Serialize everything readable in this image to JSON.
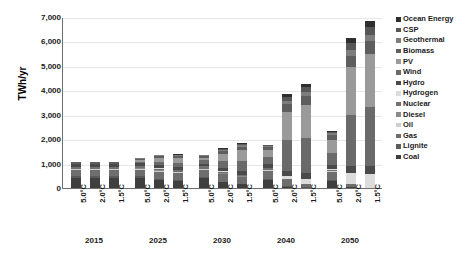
{
  "chart_data": {
    "type": "bar",
    "stacked": true,
    "title": "",
    "subtitle": "",
    "xlabel": "",
    "ylabel": "TWh/yr",
    "ylim": [
      0,
      7000
    ],
    "ytick_values": [
      0,
      1000,
      2000,
      3000,
      4000,
      5000,
      6000,
      7000
    ],
    "ytick_labels": [
      "0",
      "1,000",
      "2,000",
      "3,000",
      "4,000",
      "5,000",
      "6,000",
      "7,000"
    ],
    "grid": true,
    "legend_position": "right",
    "categories": [
      "2015 5.0°C",
      "2015 2.0°C",
      "2015 1.5°C",
      "2025 5.0°C",
      "2025 2.0°C",
      "2025 1.5°C",
      "2030 5.0°C",
      "2030 2.0°C",
      "2030 1.5°C",
      "2040 5.0°C",
      "2040 2.0°C",
      "2040 1.5°C",
      "2050 5.0°C",
      "2050 2.0°C",
      "2050 1.5°C"
    ],
    "scenario_labels": [
      "5.0°C",
      "2.0°C",
      "1.5°C"
    ],
    "year_groups": [
      "2015",
      "2025",
      "2030",
      "2040",
      "2050"
    ],
    "totals": [
      1010,
      1010,
      1010,
      1180,
      1330,
      1290,
      1420,
      1620,
      1810,
      1930,
      3820,
      4220,
      2810,
      6100,
      6720
    ],
    "series": [
      {
        "name": "Coal",
        "color": "#3f3f3f",
        "values": [
          430,
          430,
          430,
          420,
          330,
          300,
          390,
          230,
          150,
          330,
          60,
          20,
          270,
          30,
          0
        ]
      },
      {
        "name": "Lignite",
        "color": "#5a5a5a",
        "values": [
          60,
          60,
          60,
          60,
          50,
          45,
          55,
          35,
          25,
          45,
          15,
          5,
          40,
          5,
          0
        ]
      },
      {
        "name": "Gas",
        "color": "#6e6e6e",
        "values": [
          230,
          230,
          230,
          270,
          290,
          270,
          300,
          300,
          270,
          330,
          240,
          120,
          350,
          140,
          20
        ]
      },
      {
        "name": "Oil",
        "color": "#cfcfcf",
        "values": [
          40,
          40,
          40,
          35,
          30,
          28,
          30,
          25,
          20,
          28,
          12,
          6,
          25,
          6,
          0
        ]
      },
      {
        "name": "Diesel",
        "color": "#8a8a8a",
        "values": [
          25,
          25,
          25,
          22,
          20,
          18,
          20,
          16,
          12,
          18,
          8,
          4,
          16,
          4,
          0
        ]
      },
      {
        "name": "Nuclear",
        "color": "#707070",
        "values": [
          95,
          95,
          95,
          95,
          80,
          70,
          90,
          60,
          40,
          70,
          20,
          0,
          55,
          0,
          0
        ]
      },
      {
        "name": "Hydrogen",
        "color": "#dcdcdc",
        "values": [
          0,
          0,
          0,
          0,
          5,
          10,
          0,
          15,
          30,
          10,
          120,
          220,
          20,
          420,
          560
        ]
      },
      {
        "name": "Hydro",
        "color": "#4a4a4a",
        "values": [
          95,
          95,
          95,
          105,
          120,
          125,
          115,
          140,
          155,
          140,
          230,
          250,
          165,
          300,
          330
        ]
      },
      {
        "name": "Wind",
        "color": "#6a6a6a",
        "values": [
          20,
          20,
          20,
          80,
          160,
          180,
          130,
          300,
          420,
          290,
          1250,
          1420,
          500,
          2100,
          2400
        ]
      },
      {
        "name": "PV",
        "color": "#9a9a9a",
        "values": [
          10,
          10,
          10,
          60,
          150,
          180,
          110,
          290,
          430,
          290,
          1180,
          1350,
          540,
          1950,
          2180
        ]
      },
      {
        "name": "Biomass",
        "color": "#5e5e5e",
        "values": [
          45,
          45,
          45,
          60,
          80,
          90,
          75,
          110,
          140,
          120,
          320,
          360,
          190,
          470,
          510
        ]
      },
      {
        "name": "Geothermal",
        "color": "#7d7d7d",
        "values": [
          5,
          5,
          5,
          15,
          25,
          30,
          25,
          45,
          60,
          45,
          130,
          170,
          75,
          230,
          280
        ]
      },
      {
        "name": "CSP",
        "color": "#575757",
        "values": [
          2,
          2,
          2,
          10,
          15,
          20,
          15,
          35,
          50,
          35,
          150,
          200,
          50,
          270,
          320
        ]
      },
      {
        "name": "Ocean Energy",
        "color": "#2e2e2e",
        "values": [
          3,
          3,
          3,
          8,
          10,
          14,
          10,
          25,
          40,
          30,
          110,
          145,
          45,
          200,
          220
        ]
      }
    ],
    "legend_entries": [
      "Ocean Energy",
      "CSP",
      "Geothermal",
      "Biomass",
      "PV",
      "Wind",
      "Hydro",
      "Hydrogen",
      "Nuclear",
      "Diesel",
      "Oil",
      "Gas",
      "Lignite",
      "Coal"
    ]
  }
}
